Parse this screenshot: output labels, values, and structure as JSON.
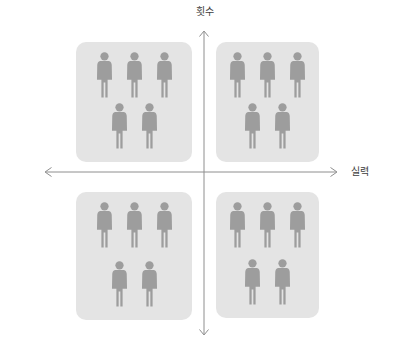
{
  "axes": {
    "y_label": "횟수",
    "x_label": "실력"
  },
  "colors": {
    "page_bg": "#ffffff",
    "quadrant_bg": "#e4e4e4",
    "person": "#9d9d9d",
    "axis": "#8e8e8e",
    "label_text": "#3d3d3d"
  },
  "quadrants": [
    {
      "id": "top-left",
      "person_rows": [
        3,
        2
      ],
      "person_count": 5
    },
    {
      "id": "top-right",
      "person_rows": [
        3,
        2
      ],
      "person_count": 5
    },
    {
      "id": "bottom-left",
      "person_rows": [
        3,
        2
      ],
      "person_count": 5
    },
    {
      "id": "bottom-right",
      "person_rows": [
        3,
        2
      ],
      "person_count": 5
    }
  ]
}
